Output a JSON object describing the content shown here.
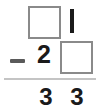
{
  "worksheet": {
    "type": "vertical-subtraction-problem",
    "operator": "−",
    "rows": {
      "minuend": {
        "tens": {
          "kind": "empty-box",
          "value": ""
        },
        "ones": {
          "kind": "digit",
          "value": "1"
        }
      },
      "subtrahend": {
        "tens": {
          "kind": "digit",
          "value": "2"
        },
        "ones": {
          "kind": "empty-box",
          "value": ""
        }
      },
      "difference": {
        "tens": {
          "kind": "digit",
          "value": "3"
        },
        "ones": {
          "kind": "digit",
          "value": "3"
        }
      }
    }
  },
  "colors": {
    "background": "#ffffff",
    "digit": "#1a1a1a",
    "box_border": "#8a8a8a",
    "rule": "#c4c4c4",
    "operator": "#5a5a5a"
  }
}
